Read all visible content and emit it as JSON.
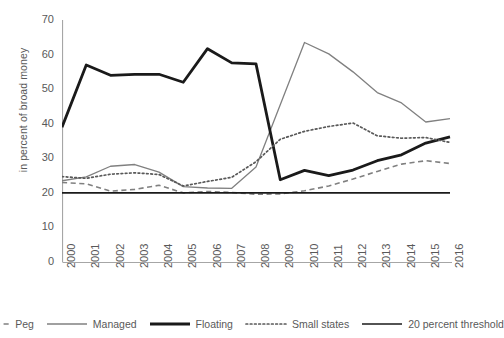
{
  "chart_data": {
    "type": "line",
    "title": "",
    "xlabel": "",
    "ylabel": "in percent of broad money",
    "ylim": [
      0,
      70
    ],
    "yticks": [
      0,
      10,
      20,
      30,
      40,
      50,
      60,
      70
    ],
    "grid": false,
    "legend_position": "bottom",
    "x": [
      "2000",
      "2001",
      "2002",
      "2003",
      "2004",
      "2005",
      "2006",
      "2007",
      "2008",
      "2009",
      "2010",
      "2011",
      "2012",
      "2013",
      "2014",
      "2015",
      "2016"
    ],
    "categories": [
      "2000",
      "2001",
      "2002",
      "2003",
      "2004",
      "2005",
      "2006",
      "2007",
      "2008",
      "2009",
      "2010",
      "2011",
      "2012",
      "2013",
      "2014",
      "2015",
      "2016"
    ],
    "series": [
      {
        "name": "Peg",
        "style": "dashed",
        "color": "#808080",
        "width": 1.6,
        "values": [
          23.0,
          22.6,
          20.5,
          21.0,
          22.2,
          20.0,
          20.4,
          20.1,
          19.6,
          19.7,
          20.6,
          22.0,
          24.0,
          26.2,
          28.3,
          29.3,
          28.5
        ]
      },
      {
        "name": "Managed",
        "style": "solid",
        "color": "#808080",
        "width": 1.3,
        "values": [
          23.5,
          24.6,
          27.7,
          28.2,
          26.0,
          21.8,
          21.4,
          21.3,
          27.5,
          45.5,
          63.5,
          60.2,
          55.0,
          49.0,
          46.0,
          40.5,
          41.5
        ]
      },
      {
        "name": "Floating",
        "style": "solid",
        "color": "#1a1a1a",
        "width": 2.8,
        "values": [
          39.0,
          57.0,
          54.0,
          54.3,
          54.3,
          52.0,
          61.7,
          57.6,
          57.3,
          23.8,
          26.5,
          25.0,
          26.6,
          29.3,
          31.0,
          34.4,
          36.2
        ]
      },
      {
        "name": "Small states",
        "style": "dotted",
        "color": "#595959",
        "width": 1.7,
        "values": [
          24.7,
          24.2,
          25.4,
          25.8,
          25.3,
          22.0,
          23.3,
          24.5,
          29.0,
          35.5,
          37.8,
          39.2,
          40.2,
          36.5,
          35.8,
          36.0,
          34.6
        ]
      },
      {
        "name": "20 percent threshold",
        "style": "solid",
        "color": "#1a1a1a",
        "width": 1.7,
        "values": [
          20,
          20,
          20,
          20,
          20,
          20,
          20,
          20,
          20,
          20,
          20,
          20,
          20,
          20,
          20,
          20,
          20
        ]
      }
    ],
    "legend": [
      {
        "label": "Peg",
        "style": "dashed",
        "color": "#808080",
        "width": 1.6
      },
      {
        "label": "Managed",
        "style": "solid",
        "color": "#808080",
        "width": 1.3
      },
      {
        "label": "Floating",
        "style": "solid",
        "color": "#1a1a1a",
        "width": 2.8
      },
      {
        "label": "Small states",
        "style": "dotted",
        "color": "#595959",
        "width": 1.7
      },
      {
        "label": "20 percent threshold",
        "style": "solid",
        "color": "#1a1a1a",
        "width": 1.7
      }
    ],
    "axis_color": "#a6a6a6"
  }
}
